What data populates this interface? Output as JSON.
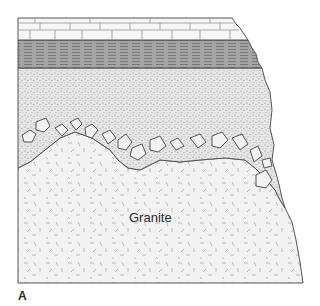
{
  "figure": {
    "panel_label": "A",
    "type": "geologic cross-section",
    "layers": [
      {
        "name": "limestone",
        "pattern": "brick",
        "labeled": false
      },
      {
        "name": "shale",
        "pattern": "horizontal-lines",
        "labeled": false
      },
      {
        "name": "sandstone",
        "pattern": "stipple",
        "labeled": false
      },
      {
        "name": "basal-conglomerate",
        "pattern": "pebbles",
        "labeled": false
      },
      {
        "name": "granite",
        "pattern": "random-dashes",
        "labeled": true,
        "label": "Granite"
      }
    ],
    "colors": {
      "outline": "#555555",
      "limestone_fill": "#f4f4f4",
      "shale_fill": "#9a9a9a",
      "sandstone_fill": "#e2e2e2",
      "granite_fill": "#f0f0f0",
      "text": "#2a2a2a"
    }
  }
}
